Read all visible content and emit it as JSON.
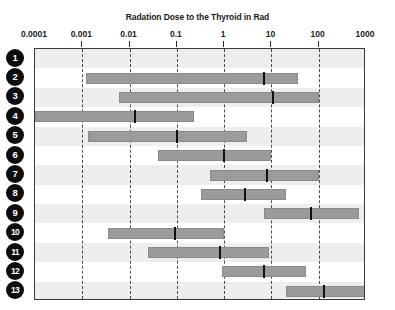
{
  "chart_data": {
    "type": "bar",
    "orientation": "horizontal",
    "subtype": "range-bar-with-median",
    "title": "Radation Dose to the Thyroid in Rad",
    "xlabel": "Radation Dose to the Thyroid in Rad",
    "ylabel": "",
    "xscale": "log",
    "xlim": [
      0.0001,
      1000
    ],
    "grid": true,
    "legend": null,
    "xticks": [
      0.0001,
      0.001,
      0.01,
      0.1,
      1,
      10,
      100,
      1000
    ],
    "xtick_labels": [
      "0.0001",
      "0.001",
      "0.01",
      "0.1",
      "1",
      "10",
      "100",
      "1000"
    ],
    "categories": [
      "1",
      "2",
      "3",
      "4",
      "5",
      "6",
      "7",
      "8",
      "9",
      "10",
      "11",
      "12",
      "13"
    ],
    "series": [
      {
        "name": "Radiation dose range (low, median, high)",
        "ranges": [
          {
            "category": "1",
            "low": null,
            "median": null,
            "high": null,
            "visible": false
          },
          {
            "category": "2",
            "low": 0.0012,
            "median": 7.0,
            "high": 36.0,
            "visible": true
          },
          {
            "category": "3",
            "low": 0.006,
            "median": 11.0,
            "high": 100.0,
            "visible": true
          },
          {
            "category": "4",
            "low": 0.0001,
            "median": 0.013,
            "high": 0.23,
            "visible": true
          },
          {
            "category": "5",
            "low": 0.0013,
            "median": 0.1,
            "high": 3.0,
            "visible": true
          },
          {
            "category": "6",
            "low": 0.04,
            "median": 1.0,
            "high": 10.0,
            "visible": true
          },
          {
            "category": "7",
            "low": 0.5,
            "median": 8.0,
            "high": 100.0,
            "visible": true
          },
          {
            "category": "8",
            "low": 0.33,
            "median": 2.8,
            "high": 20.0,
            "visible": true
          },
          {
            "category": "9",
            "low": 7.0,
            "median": 70.0,
            "high": 700.0,
            "visible": true
          },
          {
            "category": "10",
            "low": 0.0035,
            "median": 0.09,
            "high": 1.0,
            "visible": true
          },
          {
            "category": "11",
            "low": 0.025,
            "median": 0.8,
            "high": 9.0,
            "visible": true
          },
          {
            "category": "12",
            "low": 0.9,
            "median": 7.0,
            "high": 55.0,
            "visible": true
          },
          {
            "category": "13",
            "low": 20.0,
            "median": 130.0,
            "high": 1000.0,
            "visible": true
          }
        ]
      }
    ],
    "colors": {
      "bar_fill": "#9b9b9b",
      "bar_border": "#8a8a8a",
      "median_marker": "#111111",
      "gridline": "#4a4a4a",
      "frame": "#3a3a3a",
      "row_band_shaded": "#eeeeee",
      "badge_fill": "#0d0d0d",
      "badge_text": "#ffffff",
      "text": "#1a1a1a",
      "background": "#ffffff"
    }
  },
  "axis": {
    "title": "Radation Dose to the Thyroid in Rad"
  },
  "rows": [
    {
      "label": "1"
    },
    {
      "label": "2"
    },
    {
      "label": "3"
    },
    {
      "label": "4"
    },
    {
      "label": "5"
    },
    {
      "label": "6"
    },
    {
      "label": "7"
    },
    {
      "label": "8"
    },
    {
      "label": "9"
    },
    {
      "label": "10"
    },
    {
      "label": "11"
    },
    {
      "label": "12"
    },
    {
      "label": "13"
    }
  ]
}
